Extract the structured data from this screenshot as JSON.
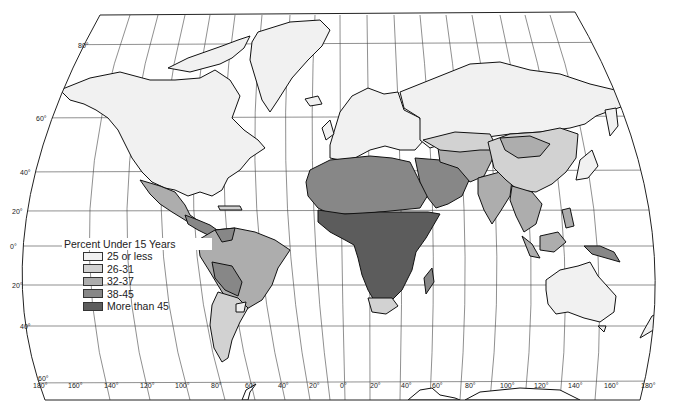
{
  "map": {
    "title": "Percent Under 15 Years",
    "projection": "world map, pseudo-cylindrical with curved sides",
    "legend": {
      "title": "Percent Under 15 Years",
      "items": [
        {
          "label": "25 or less",
          "color": "#f1f1f1"
        },
        {
          "label": "26-31",
          "color": "#d2d2d2"
        },
        {
          "label": "32-37",
          "color": "#adadad"
        },
        {
          "label": "38-45",
          "color": "#878787"
        },
        {
          "label": "More than 45",
          "color": "#5c5c5c"
        }
      ]
    },
    "latitude_labels": [
      "80°",
      "60°",
      "40°",
      "20°",
      "0°",
      "20°",
      "40°",
      "60°"
    ],
    "longitude_labels": [
      "180°",
      "160°",
      "140°",
      "120°",
      "100°",
      "80°",
      "60°",
      "40°",
      "20°",
      "0°",
      "20°",
      "40°",
      "60°",
      "80°",
      "100°",
      "120°",
      "140°",
      "160°",
      "180°"
    ],
    "regions": [
      {
        "name": "North America (USA, Canada)",
        "class": "25 or less"
      },
      {
        "name": "Greenland",
        "class": "25 or less"
      },
      {
        "name": "Mexico",
        "class": "32-37"
      },
      {
        "name": "Central America",
        "class": "38-45"
      },
      {
        "name": "Brazil / Colombia / Peru",
        "class": "32-37"
      },
      {
        "name": "Bolivia / Paraguay / Venezuela",
        "class": "38-45"
      },
      {
        "name": "Argentina / Chile",
        "class": "26-31"
      },
      {
        "name": "Uruguay",
        "class": "25 or less"
      },
      {
        "name": "Europe",
        "class": "25 or less"
      },
      {
        "name": "Russia / USSR",
        "class": "25 or less"
      },
      {
        "name": "North Africa",
        "class": "38-45"
      },
      {
        "name": "Sub-Saharan Africa",
        "class": "More than 45"
      },
      {
        "name": "South Africa",
        "class": "26-31"
      },
      {
        "name": "Middle East",
        "class": "38-45"
      },
      {
        "name": "Central Asia / Iran",
        "class": "32-37"
      },
      {
        "name": "China",
        "class": "26-31"
      },
      {
        "name": "Mongolia",
        "class": "32-37"
      },
      {
        "name": "India",
        "class": "32-37"
      },
      {
        "name": "Southeast Asia",
        "class": "32-37"
      },
      {
        "name": "Japan",
        "class": "25 or less"
      },
      {
        "name": "Papua New Guinea",
        "class": "38-45"
      },
      {
        "name": "Australia / New Zealand",
        "class": "25 or less"
      }
    ]
  }
}
